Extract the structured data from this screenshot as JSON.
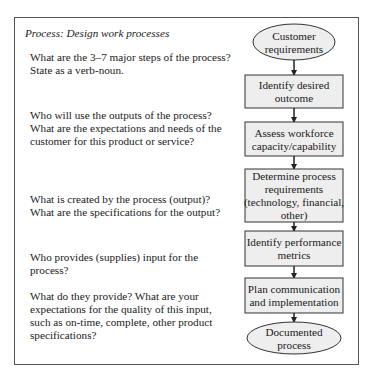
{
  "title": "Process: Design work processes",
  "questions": [
    "What are the 3–7 major steps of the process? State as a verb-noun.",
    "Who will use the outputs of the process? What are the expectations and needs of the customer for this product or service?",
    "What is created by the process (output)? What are the specifications for the output?",
    "Who provides (supplies) input for the process?",
    "What do they provide? What are your expectations for the quality of this input, such as on-time, complete, other product specifications?"
  ],
  "flow": {
    "start": [
      "Customer",
      "requirements"
    ],
    "steps": [
      [
        "Identify desired",
        "outcome"
      ],
      [
        "Assess workforce",
        "capacity/capability"
      ],
      [
        "Determine process",
        "requirements",
        "(technology, financial,",
        "other)"
      ],
      [
        "Identify performance",
        "metrics"
      ],
      [
        "Plan communication",
        "and implementation"
      ]
    ],
    "end": [
      "Documented",
      "process"
    ]
  },
  "colors": {
    "box_fill": "#eeeeee",
    "stroke": "#333333"
  }
}
